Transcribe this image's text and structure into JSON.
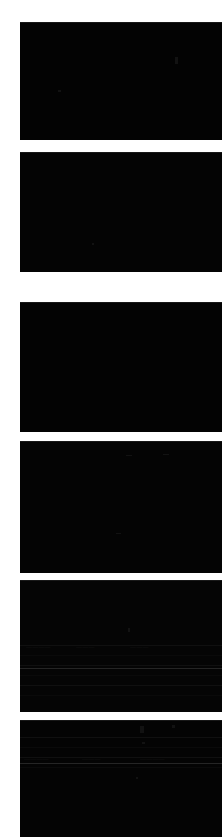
{
  "canvas": {
    "width": 222,
    "height": 837,
    "background_color": "#ffffff",
    "gutter_width": 20,
    "description": "Narrow vertical crop of a dark UI column: six stacked near-black content panels separated by thin white horizontal gaps."
  },
  "colors": {
    "page_background": "#ffffff",
    "panel_fill": "#040404",
    "panel_fill_alt": "#020202",
    "panel_edge_highlight": "#2a2a2a",
    "row_line": "#131313",
    "divider": "#303030",
    "ghost_text": "#161616"
  },
  "panels": [
    {
      "id": "panel-1",
      "label": "content-panel-1",
      "x": 20,
      "y": 22,
      "width": 202,
      "height": 118,
      "fill": "#030303",
      "has_rows": false,
      "has_divider": false,
      "specks": [
        {
          "x": 155,
          "y": 35,
          "w": 3,
          "h": 7
        },
        {
          "x": 38,
          "y": 68,
          "w": 3,
          "h": 2
        }
      ],
      "ghosts": []
    },
    {
      "id": "panel-2",
      "label": "content-panel-2",
      "x": 20,
      "y": 152,
      "width": 202,
      "height": 120,
      "fill": "#040404",
      "has_rows": false,
      "has_divider": false,
      "specks": [
        {
          "x": 72,
          "y": 91,
          "w": 2,
          "h": 2
        }
      ],
      "ghosts": []
    },
    {
      "id": "panel-3",
      "label": "content-panel-3",
      "x": 20,
      "y": 302,
      "width": 202,
      "height": 130,
      "fill": "#030303",
      "has_rows": false,
      "has_divider": false,
      "specks": [],
      "ghosts": []
    },
    {
      "id": "panel-4",
      "label": "content-panel-4",
      "x": 20,
      "y": 441,
      "width": 202,
      "height": 132,
      "fill": "#040404",
      "has_rows": false,
      "has_divider": false,
      "specks": [
        {
          "x": 106,
          "y": 14,
          "w": 6,
          "h": 1
        },
        {
          "x": 143,
          "y": 13,
          "w": 6,
          "h": 1
        },
        {
          "x": 96,
          "y": 92,
          "w": 5,
          "h": 1
        }
      ],
      "ghosts": []
    },
    {
      "id": "panel-5",
      "label": "content-panel-5",
      "x": 20,
      "y": 580,
      "width": 202,
      "height": 132,
      "fill": "#050505",
      "has_rows": true,
      "rows_top": 56,
      "rows_count": 6,
      "has_divider": true,
      "divider_y": 88,
      "specks": [
        {
          "x": 108,
          "y": 48,
          "w": 2,
          "h": 4
        }
      ],
      "ghosts": [
        {
          "text": "————",
          "x": 6,
          "y": 64
        },
        {
          "text": "———",
          "x": 56,
          "y": 64
        },
        {
          "text": "———",
          "x": 110,
          "y": 64
        }
      ]
    },
    {
      "id": "panel-6",
      "label": "content-panel-6",
      "x": 20,
      "y": 720,
      "width": 202,
      "height": 117,
      "fill": "#040404",
      "has_rows": true,
      "rows_top": 8,
      "rows_count": 4,
      "has_divider": true,
      "divider_y": 43,
      "specks": [
        {
          "x": 120,
          "y": 6,
          "w": 4,
          "h": 7
        },
        {
          "x": 152,
          "y": 5,
          "w": 3,
          "h": 3
        },
        {
          "x": 122,
          "y": 22,
          "w": 3,
          "h": 2
        },
        {
          "x": 116,
          "y": 57,
          "w": 2,
          "h": 2
        }
      ],
      "ghosts": [
        {
          "text": "————",
          "x": 4,
          "y": 36
        },
        {
          "text": "———",
          "x": 62,
          "y": 36
        },
        {
          "text": "————",
          "x": 120,
          "y": 36
        }
      ]
    }
  ],
  "gaps": [
    {
      "id": "gap-top",
      "label": "top-margin",
      "y": 0,
      "height": 22
    },
    {
      "id": "gap-1",
      "label": "panel-gap-1",
      "y": 140,
      "height": 12
    },
    {
      "id": "gap-2",
      "label": "panel-gap-2",
      "y": 272,
      "height": 30
    },
    {
      "id": "gap-3",
      "label": "panel-gap-3",
      "y": 432,
      "height": 9
    },
    {
      "id": "gap-4",
      "label": "panel-gap-4",
      "y": 573,
      "height": 7
    },
    {
      "id": "gap-5",
      "label": "panel-gap-5",
      "y": 712,
      "height": 8
    }
  ]
}
